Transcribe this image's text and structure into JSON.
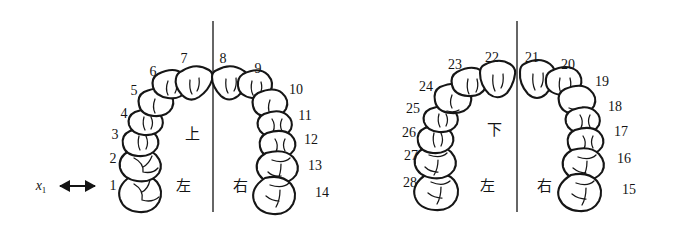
{
  "figure": {
    "type": "dental-arch-diagram",
    "background_color": "#ffffff",
    "ink_color": "#161616",
    "annotation": {
      "variable_label": "x",
      "variable_subscript": "1",
      "arrow": "double-headed-horizontal-arrow",
      "points_to_tooth": "1"
    },
    "arches": [
      {
        "id": "upper",
        "jaw_label": "上",
        "side_labels": {
          "left": "左",
          "right": "右"
        },
        "midline": true,
        "teeth": [
          {
            "number": "1",
            "side": "left",
            "kind": "molar"
          },
          {
            "number": "2",
            "side": "left",
            "kind": "molar"
          },
          {
            "number": "3",
            "side": "left",
            "kind": "premolar"
          },
          {
            "number": "4",
            "side": "left",
            "kind": "premolar"
          },
          {
            "number": "5",
            "side": "left",
            "kind": "canine"
          },
          {
            "number": "6",
            "side": "left",
            "kind": "incisor"
          },
          {
            "number": "7",
            "side": "left",
            "kind": "incisor"
          },
          {
            "number": "8",
            "side": "right",
            "kind": "incisor"
          },
          {
            "number": "9",
            "side": "right",
            "kind": "incisor"
          },
          {
            "number": "10",
            "side": "right",
            "kind": "canine"
          },
          {
            "number": "11",
            "side": "right",
            "kind": "premolar"
          },
          {
            "number": "12",
            "side": "right",
            "kind": "premolar"
          },
          {
            "number": "13",
            "side": "right",
            "kind": "molar"
          },
          {
            "number": "14",
            "side": "right",
            "kind": "molar"
          }
        ]
      },
      {
        "id": "lower",
        "jaw_label": "下",
        "side_labels": {
          "left": "左",
          "right": "右"
        },
        "midline": true,
        "teeth": [
          {
            "number": "28",
            "side": "left",
            "kind": "molar"
          },
          {
            "number": "27",
            "side": "left",
            "kind": "molar"
          },
          {
            "number": "26",
            "side": "left",
            "kind": "premolar"
          },
          {
            "number": "25",
            "side": "left",
            "kind": "premolar"
          },
          {
            "number": "24",
            "side": "left",
            "kind": "canine"
          },
          {
            "number": "23",
            "side": "left",
            "kind": "incisor"
          },
          {
            "number": "22",
            "side": "left",
            "kind": "incisor"
          },
          {
            "number": "21",
            "side": "right",
            "kind": "incisor"
          },
          {
            "number": "20",
            "side": "right",
            "kind": "incisor"
          },
          {
            "number": "19",
            "side": "right",
            "kind": "canine"
          },
          {
            "number": "18",
            "side": "right",
            "kind": "premolar"
          },
          {
            "number": "17",
            "side": "right",
            "kind": "premolar"
          },
          {
            "number": "16",
            "side": "right",
            "kind": "molar"
          },
          {
            "number": "15",
            "side": "right",
            "kind": "molar"
          }
        ]
      }
    ]
  },
  "labels": {
    "upper_jaw": "上",
    "lower_jaw": "下",
    "left": "左",
    "right": "右",
    "x_main": "x",
    "x_sub": "1",
    "n1": "1",
    "n2": "2",
    "n3": "3",
    "n4": "4",
    "n5": "5",
    "n6": "6",
    "n7": "7",
    "n8": "8",
    "n9": "9",
    "n10": "10",
    "n11": "11",
    "n12": "12",
    "n13": "13",
    "n14": "14",
    "n15": "15",
    "n16": "16",
    "n17": "17",
    "n18": "18",
    "n19": "19",
    "n20": "20",
    "n21": "21",
    "n22": "22",
    "n23": "23",
    "n24": "24",
    "n25": "25",
    "n26": "26",
    "n27": "27",
    "n28": "28"
  }
}
